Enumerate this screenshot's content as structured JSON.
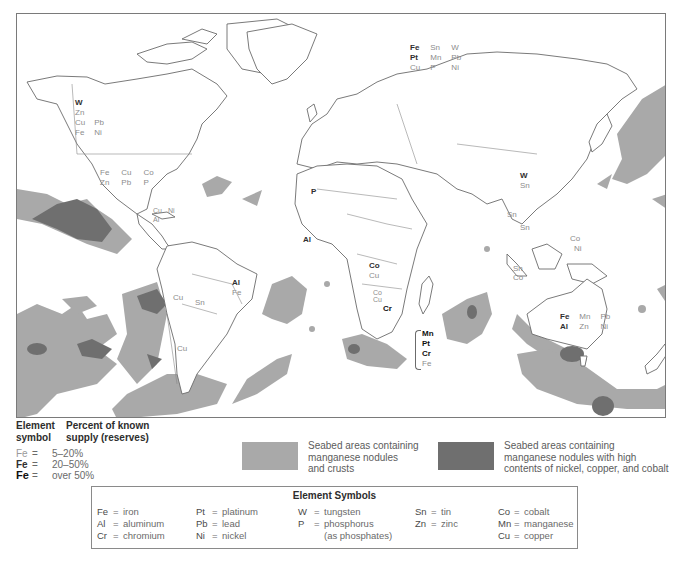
{
  "map": {
    "colors": {
      "land_fill": "#ffffff",
      "coast_stroke": "#6b6b6b",
      "seabed_nodules": "#a9a9a9",
      "seabed_high_nickel": "#6f6f6f",
      "frame": "#7a7a7a"
    },
    "region_labels": [
      {
        "region": "western-canada",
        "rows": [
          [
            {
              "t": "W",
              "lv": 2
            }
          ],
          [
            {
              "t": "Zn",
              "lv": 1
            }
          ],
          [
            {
              "t": "Cu",
              "lv": 1
            },
            {
              "t": "Pb",
              "lv": 1
            }
          ],
          [
            {
              "t": "Fe",
              "lv": 1
            },
            {
              "t": "Ni",
              "lv": 1
            }
          ]
        ]
      },
      {
        "region": "united-states",
        "rows": [
          [
            {
              "t": "Fe",
              "lv": 1
            },
            {
              "t": "Cu",
              "lv": 1
            },
            {
              "t": "Co",
              "lv": 1
            }
          ],
          [
            {
              "t": "Zn",
              "lv": 1
            },
            {
              "t": "Pb",
              "lv": 1
            },
            {
              "t": "P",
              "lv": 1
            }
          ]
        ]
      },
      {
        "region": "caribbean",
        "rows": [
          [
            {
              "t": "Cu",
              "lv": 1
            },
            {
              "t": "Ni",
              "lv": 1
            }
          ],
          [
            {
              "t": "Al",
              "lv": 1
            }
          ]
        ]
      },
      {
        "region": "brazil",
        "rows": [
          [
            {
              "t": "Al",
              "lv": 2
            }
          ],
          [
            {
              "t": "Fe",
              "lv": 1
            }
          ]
        ]
      },
      {
        "region": "peru",
        "rows": [
          [
            {
              "t": "Cu",
              "lv": 1
            }
          ]
        ]
      },
      {
        "region": "bolivia",
        "rows": [
          [
            {
              "t": "Sn",
              "lv": 1
            }
          ]
        ]
      },
      {
        "region": "chile",
        "rows": [
          [
            {
              "t": "Cu",
              "lv": 1
            }
          ]
        ]
      },
      {
        "region": "russia",
        "rows": [
          [
            {
              "t": "Fe",
              "lv": 2
            },
            {
              "t": "Sn",
              "lv": 1
            },
            {
              "t": "W",
              "lv": 1
            }
          ],
          [
            {
              "t": "Pt",
              "lv": 2
            },
            {
              "t": "Mn",
              "lv": 1
            },
            {
              "t": "Pb",
              "lv": 1
            }
          ],
          [
            {
              "t": "Cu",
              "lv": 1
            },
            {
              "t": "P",
              "lv": 1
            },
            {
              "t": "Ni",
              "lv": 1
            }
          ]
        ]
      },
      {
        "region": "morocco",
        "rows": [
          [
            {
              "t": "P",
              "lv": 2
            }
          ]
        ]
      },
      {
        "region": "guinea",
        "rows": [
          [
            {
              "t": "Al",
              "lv": 2
            }
          ]
        ]
      },
      {
        "region": "zaire",
        "rows": [
          [
            {
              "t": "Co",
              "lv": 2
            }
          ],
          [
            {
              "t": "Cu",
              "lv": 1
            }
          ]
        ]
      },
      {
        "region": "zambia",
        "rows": [
          [
            {
              "t": "Co",
              "lv": 1
            }
          ],
          [
            {
              "t": "Cu",
              "lv": 1
            }
          ]
        ]
      },
      {
        "region": "zimbabwe",
        "rows": [
          [
            {
              "t": "Cr",
              "lv": 3
            }
          ]
        ]
      },
      {
        "region": "south-africa",
        "rows": [
          [
            {
              "t": "Mn",
              "lv": 3
            }
          ],
          [
            {
              "t": "Pt",
              "lv": 3
            }
          ],
          [
            {
              "t": "Cr",
              "lv": 3
            }
          ],
          [
            {
              "t": "Fe",
              "lv": 1
            }
          ]
        ]
      },
      {
        "region": "china",
        "rows": [
          [
            {
              "t": "W",
              "lv": 2
            }
          ],
          [
            {
              "t": "Sn",
              "lv": 1
            }
          ]
        ]
      },
      {
        "region": "burma",
        "rows": [
          [
            {
              "t": "Sn",
              "lv": 1
            }
          ]
        ]
      },
      {
        "region": "thailand",
        "rows": [
          [
            {
              "t": "Sn",
              "lv": 1
            }
          ]
        ]
      },
      {
        "region": "indonesia",
        "rows": [
          [
            {
              "t": "Sn",
              "lv": 1
            }
          ],
          [
            {
              "t": "Co",
              "lv": 1
            }
          ]
        ]
      },
      {
        "region": "philippines",
        "rows": [
          [
            {
              "t": "Co",
              "lv": 1
            }
          ],
          [
            {
              "t": "Ni",
              "lv": 1
            }
          ]
        ]
      },
      {
        "region": "australia",
        "rows": [
          [
            {
              "t": "Fe",
              "lv": 2
            },
            {
              "t": "Mn",
              "lv": 1
            },
            {
              "t": "Pb",
              "lv": 1
            }
          ],
          [
            {
              "t": "Al",
              "lv": 2
            },
            {
              "t": "Zn",
              "lv": 1
            },
            {
              "t": "Ni",
              "lv": 1
            }
          ]
        ]
      }
    ]
  },
  "legend": {
    "supply": {
      "header_col1": "Element symbol",
      "header_col1_line1": "Element",
      "header_col1_line2": "symbol",
      "header_col2_line1": "Percent of known",
      "header_col2_line2": "supply (reserves)",
      "rows": [
        {
          "symbol": "Fe",
          "eq": "=",
          "range": "5–20%"
        },
        {
          "symbol": "Fe",
          "eq": "=",
          "range": "20–50%"
        },
        {
          "symbol": "Fe",
          "eq": "=",
          "range": "over 50%"
        }
      ]
    },
    "seabed": [
      {
        "color": "#a9a9a9",
        "line1": "Seabed areas containing",
        "line2": "manganese nodules",
        "line3": "and crusts"
      },
      {
        "color": "#6f6f6f",
        "line1": "Seabed areas containing",
        "line2": "manganese nodules with high",
        "line3": "contents of nickel, copper, and cobalt"
      }
    ],
    "element_symbols": {
      "title": "Element Symbols",
      "columns": [
        [
          {
            "s": "Fe",
            "name": "iron"
          },
          {
            "s": "Al",
            "name": "aluminum"
          },
          {
            "s": "Cr",
            "name": "chromium"
          }
        ],
        [
          {
            "s": "Pt",
            "name": "platinum"
          },
          {
            "s": "Pb",
            "name": "lead"
          },
          {
            "s": "Ni",
            "name": "nickel"
          }
        ],
        [
          {
            "s": "W",
            "name": "tungsten"
          },
          {
            "s": "P",
            "name": "phosphorus",
            "note": "(as phosphates)"
          }
        ],
        [
          {
            "s": "Sn",
            "name": "tin"
          },
          {
            "s": "Zn",
            "name": "zinc"
          }
        ],
        [
          {
            "s": "Co",
            "name": "cobalt"
          },
          {
            "s": "Mn",
            "name": "manganese"
          },
          {
            "s": "Cu",
            "name": "copper"
          }
        ]
      ]
    }
  }
}
